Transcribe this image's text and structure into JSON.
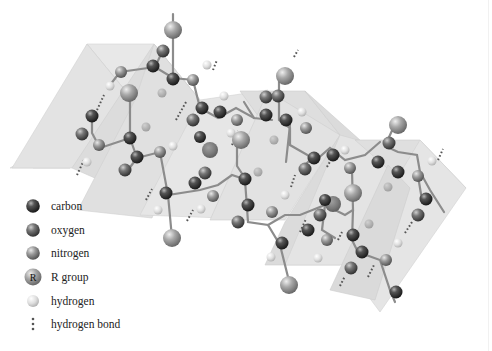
{
  "figure": {
    "colors": {
      "background": "#ffffff",
      "plane_light": "#e6e6e6",
      "plane_mid": "#d9d9d9",
      "plane_dark": "#cfcfcf",
      "carbon": "#3a3a3a",
      "oxygen": "#5e5e5e",
      "nitrogen": "#8a8a8a",
      "r_group": "#9a9a9a",
      "hydrogen": "#d8d8d8",
      "bond": "#bdbdbd",
      "hbond": "#555555"
    }
  },
  "legend": {
    "items": [
      {
        "key": "carbon",
        "label": "carbon"
      },
      {
        "key": "oxygen",
        "label": "oxygen"
      },
      {
        "key": "nitrogen",
        "label": "nitrogen"
      },
      {
        "key": "r_group",
        "label": "R group",
        "glyph": "R"
      },
      {
        "key": "hydrogen",
        "label": "hydrogen"
      },
      {
        "key": "hbond",
        "label": "hydrogen bond"
      }
    ]
  }
}
